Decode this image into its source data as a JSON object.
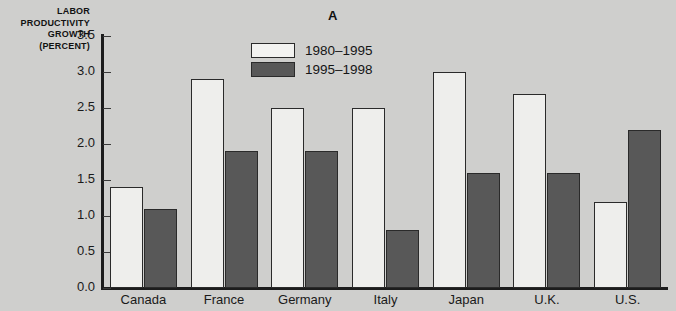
{
  "chart_data": {
    "type": "bar",
    "title": "A",
    "xlabel": "",
    "ylabel": "LABOR PRODUCTIVITY GROWTH (PERCENT)",
    "ylabel_lines": [
      "LABOR",
      "PRODUCTIVITY",
      "GROWTH",
      "(PERCENT)"
    ],
    "categories": [
      "Canada",
      "France",
      "Germany",
      "Italy",
      "Japan",
      "U.K.",
      "U.S."
    ],
    "series": [
      {
        "name": "1980-1995",
        "values": [
          1.4,
          2.9,
          2.5,
          2.5,
          3.0,
          2.7,
          1.2
        ],
        "color": "#eeeeec"
      },
      {
        "name": "1995-1998",
        "values": [
          1.1,
          1.9,
          1.9,
          0.8,
          1.6,
          1.6,
          2.2
        ],
        "color": "#585858"
      }
    ],
    "ylim": [
      0.0,
      3.5
    ],
    "ytick_labels": [
      "0.0",
      "0.5",
      "1.0",
      "1.5",
      "2.0",
      "2.5",
      "3.0",
      "3.5"
    ],
    "ytick_values": [
      0.0,
      0.5,
      1.0,
      1.5,
      2.0,
      2.5,
      3.0,
      3.5
    ],
    "grid": false,
    "legend_position": "top-center"
  },
  "legend": {
    "entries": [
      {
        "label": "1980–1995",
        "style": "light"
      },
      {
        "label": "1995–1998",
        "style": "dark"
      }
    ]
  },
  "colors": {
    "background": "#cfcfcd",
    "axis": "#1c1c1c",
    "bar_light": "#eeeeec",
    "bar_dark": "#585858",
    "text": "#1a1a1a"
  }
}
